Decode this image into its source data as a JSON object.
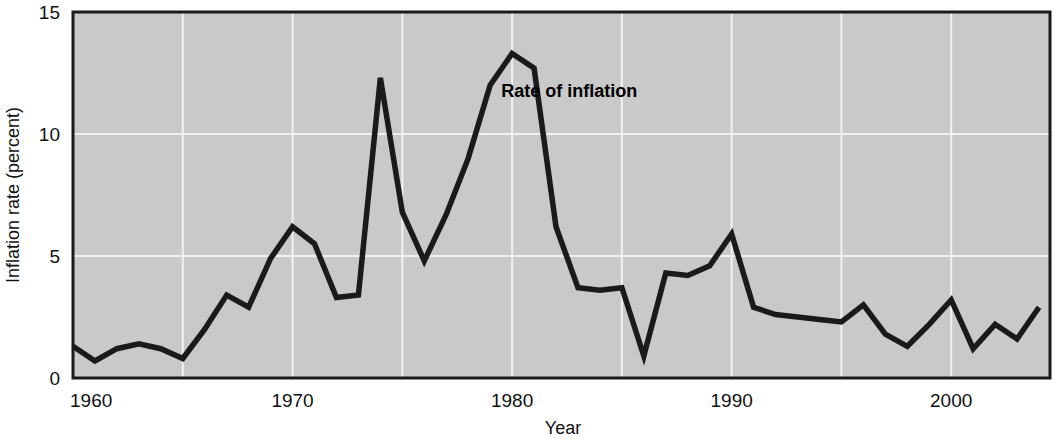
{
  "chart_data": {
    "type": "line",
    "title": "",
    "subtitle": "",
    "xlabel": "Year",
    "ylabel": "Inflation rate (percent)",
    "xlim": [
      1960,
      2004.5
    ],
    "ylim": [
      0,
      15
    ],
    "x_ticks": [
      1960,
      1970,
      1980,
      1990,
      2000
    ],
    "x_tick_labels": [
      "1960",
      "1970",
      "1980",
      "1990",
      "2000"
    ],
    "x_gridlines": [
      1965,
      1970,
      1975,
      1980,
      1985,
      1990,
      1995,
      2000
    ],
    "y_ticks": [
      0,
      5,
      10,
      15
    ],
    "y_tick_labels": [
      "0",
      "5",
      "10",
      "15"
    ],
    "y_gridlines": [
      5,
      10
    ],
    "grid": true,
    "legend_position": "inline-annotation",
    "annotations": [
      {
        "text": "Rate of inflation",
        "x": 1982.6,
        "y": 11.5
      }
    ],
    "series": [
      {
        "name": "Rate of inflation",
        "x": [
          1960,
          1961,
          1962,
          1963,
          1964,
          1965,
          1966,
          1967,
          1968,
          1969,
          1970,
          1971,
          1972,
          1973,
          1974,
          1975,
          1976,
          1977,
          1978,
          1979,
          1980,
          1981,
          1982,
          1983,
          1984,
          1985,
          1986,
          1987,
          1988,
          1989,
          1990,
          1991,
          1992,
          1993,
          1994,
          1995,
          1996,
          1997,
          1998,
          1999,
          2000,
          2001,
          2002,
          2003,
          2004
        ],
        "values": [
          1.3,
          0.7,
          1.2,
          1.4,
          1.2,
          0.8,
          2.0,
          3.4,
          2.9,
          4.9,
          6.2,
          5.5,
          3.3,
          3.4,
          12.3,
          6.8,
          4.8,
          6.7,
          9.0,
          12.0,
          13.3,
          12.7,
          6.2,
          3.7,
          3.6,
          3.7,
          0.9,
          4.3,
          4.2,
          4.6,
          5.9,
          2.9,
          2.6,
          2.5,
          2.4,
          2.3,
          3.0,
          1.8,
          1.3,
          2.2,
          3.2,
          1.2,
          2.2,
          1.6,
          2.9
        ]
      }
    ],
    "colors": {
      "line": "#1a1a1a",
      "plot_background": "#c9c9c9",
      "gridline": "#f2f2f2",
      "frame": "#1a1a1a",
      "text": "#111111"
    }
  }
}
